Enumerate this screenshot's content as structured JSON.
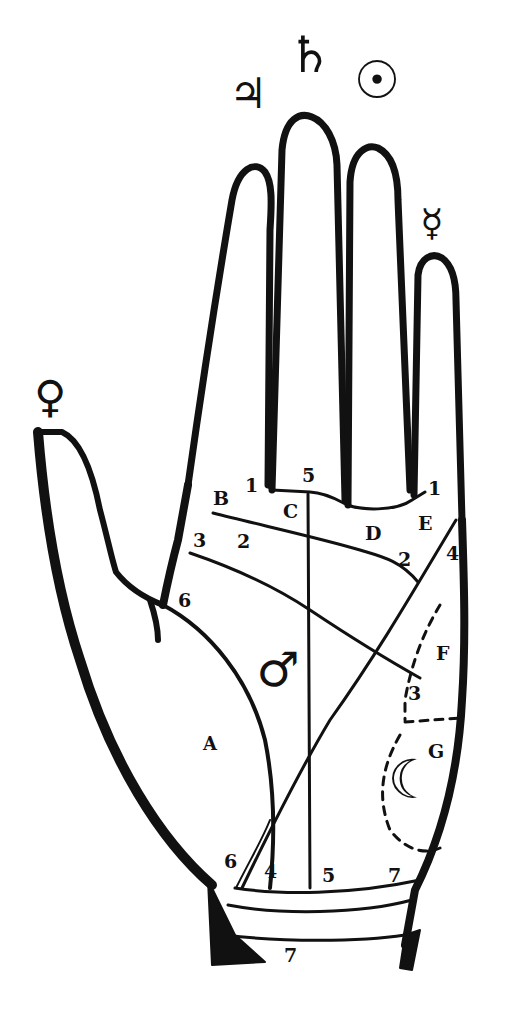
{
  "diagram": {
    "colors": {
      "ink": "#111111",
      "paper": "#ffffff"
    },
    "planet_symbols": [
      {
        "name": "jupiter",
        "glyph": "♃",
        "finger": "index"
      },
      {
        "name": "saturn",
        "glyph": "♄",
        "finger": "middle"
      },
      {
        "name": "sun",
        "glyph": "☉",
        "finger": "ring"
      },
      {
        "name": "mercury",
        "glyph": "☿",
        "finger": "little"
      },
      {
        "name": "venus",
        "glyph": "♀",
        "finger": "thumb"
      },
      {
        "name": "mars",
        "glyph": "♂",
        "region": "palm-center"
      },
      {
        "name": "moon",
        "glyph": "☾",
        "region": "mount-of-moon"
      }
    ],
    "region_labels": {
      "A": "A",
      "B": "B",
      "C": "C",
      "D": "D",
      "E": "E",
      "F": "F",
      "G": "G"
    },
    "line_numbers": {
      "n1_left": "1",
      "n1_right": "1",
      "n2_left": "2",
      "n2_right": "2",
      "n3_left": "3",
      "n3_right": "3",
      "n4_top": "4",
      "n4_bottom": "4",
      "n5_top": "5",
      "n5_bottom": "5",
      "n6_top": "6",
      "n6_bottom": "6",
      "n7_right": "7",
      "n7_bottom": "7"
    }
  }
}
